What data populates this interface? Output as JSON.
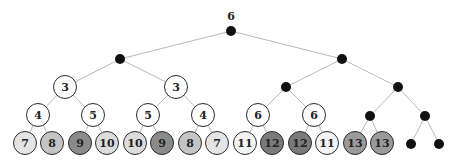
{
  "diagram": {
    "type": "binary-tree",
    "root_label": "6",
    "colors": {
      "edge": "#b8b8b8",
      "dot": "#111111",
      "white": "#ffffff",
      "light": "#e4e4e4",
      "mid": "#c4c4c4",
      "dark": "#8a8a8a",
      "darker": "#7a7a7a"
    },
    "nodes": [
      {
        "id": "r",
        "x": 231,
        "y": 31,
        "kind": "dot"
      },
      {
        "id": "L",
        "x": 120,
        "y": 59,
        "kind": "dot",
        "parent": "r"
      },
      {
        "id": "R",
        "x": 342,
        "y": 59,
        "kind": "dot",
        "parent": "r"
      },
      {
        "id": "LL",
        "x": 65,
        "y": 87,
        "kind": "circle",
        "label": "3",
        "fill": "#ffffff",
        "parent": "L"
      },
      {
        "id": "LR",
        "x": 176,
        "y": 87,
        "kind": "circle",
        "label": "3",
        "fill": "#ffffff",
        "parent": "L"
      },
      {
        "id": "RL",
        "x": 286,
        "y": 87,
        "kind": "dot",
        "parent": "R"
      },
      {
        "id": "RR",
        "x": 398,
        "y": 87,
        "kind": "dot",
        "parent": "R"
      },
      {
        "id": "LLL",
        "x": 38,
        "y": 115,
        "kind": "circle",
        "label": "4",
        "fill": "#ffffff",
        "parent": "LL"
      },
      {
        "id": "LLR",
        "x": 93,
        "y": 115,
        "kind": "circle",
        "label": "5",
        "fill": "#ffffff",
        "parent": "LL"
      },
      {
        "id": "LRL",
        "x": 148,
        "y": 115,
        "kind": "circle",
        "label": "5",
        "fill": "#ffffff",
        "parent": "LR"
      },
      {
        "id": "LRR",
        "x": 203,
        "y": 115,
        "kind": "circle",
        "label": "4",
        "fill": "#ffffff",
        "parent": "LR"
      },
      {
        "id": "RLL",
        "x": 258,
        "y": 115,
        "kind": "circle",
        "label": "6",
        "fill": "#ffffff",
        "parent": "RL"
      },
      {
        "id": "RLR",
        "x": 314,
        "y": 115,
        "kind": "circle",
        "label": "6",
        "fill": "#ffffff",
        "parent": "RL"
      },
      {
        "id": "RRL",
        "x": 370,
        "y": 116,
        "kind": "dot",
        "parent": "RR"
      },
      {
        "id": "RRR",
        "x": 425,
        "y": 116,
        "kind": "dot",
        "parent": "RR"
      },
      {
        "id": "l1",
        "x": 25,
        "y": 143,
        "kind": "circle",
        "label": "7",
        "fill": "#e4e4e4",
        "parent": "LLL"
      },
      {
        "id": "l2",
        "x": 52,
        "y": 143,
        "kind": "circle",
        "label": "8",
        "fill": "#c4c4c4",
        "parent": "LLL"
      },
      {
        "id": "l3",
        "x": 80,
        "y": 143,
        "kind": "circle",
        "label": "9",
        "fill": "#8a8a8a",
        "parent": "LLR"
      },
      {
        "id": "l4",
        "x": 107,
        "y": 143,
        "kind": "circle",
        "label": "10",
        "fill": "#dcdcdc",
        "parent": "LLR"
      },
      {
        "id": "l5",
        "x": 135,
        "y": 143,
        "kind": "circle",
        "label": "10",
        "fill": "#dcdcdc",
        "parent": "LRL"
      },
      {
        "id": "l6",
        "x": 162,
        "y": 143,
        "kind": "circle",
        "label": "9",
        "fill": "#8a8a8a",
        "parent": "LRL"
      },
      {
        "id": "l7",
        "x": 190,
        "y": 143,
        "kind": "circle",
        "label": "8",
        "fill": "#c4c4c4",
        "parent": "LRR"
      },
      {
        "id": "l8",
        "x": 217,
        "y": 143,
        "kind": "circle",
        "label": "7",
        "fill": "#e4e4e4",
        "parent": "LRR"
      },
      {
        "id": "l9",
        "x": 245,
        "y": 143,
        "kind": "circle",
        "label": "11",
        "fill": "#f4f4f4",
        "parent": "RLL"
      },
      {
        "id": "l10",
        "x": 272,
        "y": 143,
        "kind": "circle",
        "label": "12",
        "fill": "#7a7a7a",
        "parent": "RLL"
      },
      {
        "id": "l11",
        "x": 300,
        "y": 143,
        "kind": "circle",
        "label": "12",
        "fill": "#7a7a7a",
        "parent": "RLR"
      },
      {
        "id": "l12",
        "x": 327,
        "y": 143,
        "kind": "circle",
        "label": "11",
        "fill": "#f4f4f4",
        "parent": "RLR"
      },
      {
        "id": "l13",
        "x": 355,
        "y": 143,
        "kind": "circle",
        "label": "13",
        "fill": "#9a9a9a",
        "parent": "RRL"
      },
      {
        "id": "l14",
        "x": 382,
        "y": 143,
        "kind": "circle",
        "label": "13",
        "fill": "#9a9a9a",
        "parent": "RRL"
      },
      {
        "id": "l15",
        "x": 411,
        "y": 144,
        "kind": "dot",
        "parent": "RRR"
      },
      {
        "id": "l16",
        "x": 439,
        "y": 144,
        "kind": "dot",
        "parent": "RRR"
      }
    ]
  }
}
